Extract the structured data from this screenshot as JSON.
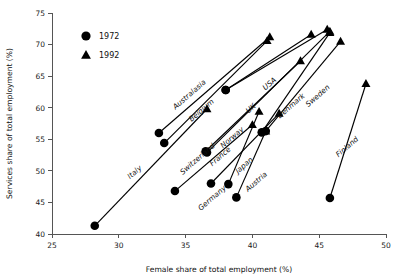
{
  "chart_data": {
    "type": "scatter",
    "title": "",
    "xlabel": "Female share of total employment (%)",
    "ylabel": "Services share of total employment (%)",
    "xlim": [
      25,
      50
    ],
    "ylim": [
      40,
      75
    ],
    "xticks": [
      25,
      30,
      35,
      40,
      45,
      50
    ],
    "yticks": [
      40,
      45,
      50,
      55,
      60,
      65,
      70,
      75
    ],
    "grid": false,
    "legend_position": "top-left",
    "legend": [
      {
        "label": "1972",
        "marker": "circle"
      },
      {
        "label": "1992",
        "marker": "triangle"
      }
    ],
    "series": [
      {
        "name": "1972",
        "marker": "circle"
      },
      {
        "name": "1992",
        "marker": "triangle"
      }
    ],
    "points": [
      {
        "country": "Italy",
        "x1972": 28.2,
        "y1972": 41.3,
        "x1992": 36.6,
        "y1992": 59.8,
        "label_x": 31.3,
        "label_y": 49.5,
        "label_angle": -41
      },
      {
        "country": "Australasia",
        "x1972": 33.0,
        "y1972": 56.0,
        "x1992": 41.3,
        "y1992": 71.2,
        "label_x": 35.4,
        "label_y": 61.8,
        "label_angle": -41
      },
      {
        "country": "Belgium",
        "x1972": 33.4,
        "y1972": 54.4,
        "x1992": 41.1,
        "y1992": 70.6,
        "label_x": 36.3,
        "label_y": 59.3,
        "label_angle": -41
      },
      {
        "country": "Switzerland",
        "x1972": 34.2,
        "y1972": 46.8,
        "x1992": 40.0,
        "y1992": 57.3,
        "label_x": 36.0,
        "label_y": 51.6,
        "label_angle": -41
      },
      {
        "country": "France",
        "x1972": 36.5,
        "y1972": 53.1,
        "x1992": 43.6,
        "y1992": 67.4,
        "label_x": 37.7,
        "label_y": 52.0,
        "label_angle": -41
      },
      {
        "country": "Germany",
        "x1972": 36.9,
        "y1972": 48.0,
        "x1992": 42.0,
        "y1992": 59.1,
        "label_x": 37.1,
        "label_y": 45.4,
        "label_angle": -41
      },
      {
        "country": "Norway",
        "x1972": 36.6,
        "y1972": 52.9,
        "x1992": 45.8,
        "y1992": 72.1,
        "label_x": 38.6,
        "label_y": 55.0,
        "label_angle": -41
      },
      {
        "country": "Japan",
        "x1972": 38.2,
        "y1972": 47.9,
        "x1992": 40.5,
        "y1992": 59.4,
        "label_x": 39.5,
        "label_y": 50.6,
        "label_angle": -41
      },
      {
        "country": "Austria",
        "x1972": 38.8,
        "y1972": 45.8,
        "x1992": 41.0,
        "y1992": 56.3,
        "label_x": 40.4,
        "label_y": 48.0,
        "label_angle": -41
      },
      {
        "country": "UK",
        "x1972": 38.0,
        "y1972": 62.8,
        "x1992": 44.4,
        "y1992": 71.6,
        "label_x": 40.0,
        "label_y": 59.6,
        "label_angle": -41
      },
      {
        "country": "USA",
        "x1972": 38.0,
        "y1972": 62.8,
        "x1992": 45.6,
        "y1992": 72.4,
        "label_x": 41.4,
        "label_y": 63.5,
        "label_angle": -41
      },
      {
        "country": "Denmark",
        "x1972": 40.7,
        "y1972": 56.1,
        "x1992": 45.8,
        "y1992": 71.9,
        "label_x": 43.0,
        "label_y": 60.0,
        "label_angle": -41
      },
      {
        "country": "Sweden",
        "x1972": 41.0,
        "y1972": 56.3,
        "x1992": 46.6,
        "y1992": 70.5,
        "label_x": 45.0,
        "label_y": 61.6,
        "label_angle": -41
      },
      {
        "country": "Finland",
        "x1972": 45.8,
        "y1972": 45.7,
        "x1992": 48.5,
        "y1992": 63.8,
        "label_x": 47.2,
        "label_y": 53.5,
        "label_angle": -41
      }
    ]
  }
}
